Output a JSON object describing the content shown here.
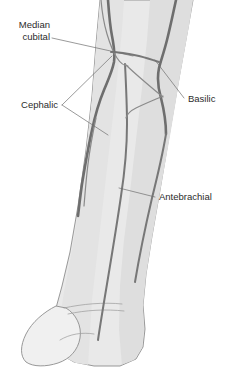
{
  "figure": {
    "background_color": "#ffffff",
    "skin_fill_color": "#e9e9e9",
    "skin_outline_color": "#8d8d8d",
    "vein_color": "#6e6e6e",
    "leader_line_color": "#6f6f6f",
    "label_text_color": "#2b2b2b"
  },
  "labels": {
    "median_cubital_line1": "Median",
    "median_cubital_line2": "cubital",
    "cephalic": "Cephalic",
    "basilic": "Basilic",
    "antebrachial": "Antebrachial"
  },
  "structures": [
    {
      "name": "median-cubital-vein",
      "label": "Median cubital",
      "position": "upper-center, oblique connector across the cubital fossa"
    },
    {
      "name": "cephalic-vein",
      "label": "Cephalic",
      "position": "lateral / left side of forearm, two branches indicated"
    },
    {
      "name": "basilic-vein",
      "label": "Basilic",
      "position": "medial / right side of forearm"
    },
    {
      "name": "antebrachial-vein",
      "label": "Antebrachial",
      "position": "central, running down the middle of the forearm"
    }
  ]
}
